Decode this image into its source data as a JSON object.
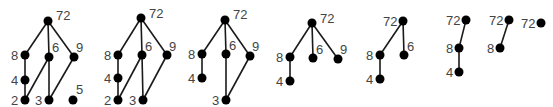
{
  "colors": {
    "node": "#000000",
    "edge": "#1a1a1a",
    "label": "#444444",
    "background": "#ffffff"
  },
  "diagrams": [
    {
      "name": "hasse-1",
      "nodes": [
        {
          "id": "72",
          "x": 48,
          "y": 21,
          "lx": 56,
          "ly": 20
        },
        {
          "id": "8",
          "x": 25,
          "y": 55,
          "lx": 11,
          "ly": 60
        },
        {
          "id": "6",
          "x": 49,
          "y": 57,
          "lx": 52,
          "ly": 52
        },
        {
          "id": "9",
          "x": 74,
          "y": 57,
          "lx": 76,
          "ly": 52
        },
        {
          "id": "4",
          "x": 25,
          "y": 80,
          "lx": 11,
          "ly": 85
        },
        {
          "id": "2",
          "x": 25,
          "y": 100,
          "lx": 11,
          "ly": 105
        },
        {
          "id": "3",
          "x": 49,
          "y": 100,
          "lx": 35,
          "ly": 105
        },
        {
          "id": "5",
          "x": 73,
          "y": 100,
          "lx": 76,
          "ly": 94
        }
      ],
      "edges": [
        [
          "72",
          "8"
        ],
        [
          "72",
          "6"
        ],
        [
          "72",
          "9"
        ],
        [
          "8",
          "4"
        ],
        [
          "4",
          "2"
        ],
        [
          "6",
          "2"
        ],
        [
          "6",
          "3"
        ],
        [
          "9",
          "3"
        ]
      ]
    },
    {
      "name": "hasse-2",
      "nodes": [
        {
          "id": "72",
          "x": 141,
          "y": 18,
          "lx": 149,
          "ly": 18
        },
        {
          "id": "8",
          "x": 118,
          "y": 55,
          "lx": 104,
          "ly": 60
        },
        {
          "id": "6",
          "x": 142,
          "y": 55,
          "lx": 145,
          "ly": 51
        },
        {
          "id": "9",
          "x": 167,
          "y": 55,
          "lx": 169,
          "ly": 51
        },
        {
          "id": "4",
          "x": 118,
          "y": 78,
          "lx": 104,
          "ly": 83
        },
        {
          "id": "2",
          "x": 118,
          "y": 100,
          "lx": 104,
          "ly": 105
        },
        {
          "id": "3",
          "x": 143,
          "y": 100,
          "lx": 129,
          "ly": 105
        }
      ],
      "edges": [
        [
          "72",
          "8"
        ],
        [
          "72",
          "6"
        ],
        [
          "72",
          "9"
        ],
        [
          "8",
          "4"
        ],
        [
          "4",
          "2"
        ],
        [
          "6",
          "2"
        ],
        [
          "6",
          "3"
        ],
        [
          "9",
          "3"
        ]
      ]
    },
    {
      "name": "hasse-3",
      "nodes": [
        {
          "id": "72",
          "x": 225,
          "y": 20,
          "lx": 233,
          "ly": 19
        },
        {
          "id": "8",
          "x": 202,
          "y": 54,
          "lx": 188,
          "ly": 59
        },
        {
          "id": "6",
          "x": 226,
          "y": 54,
          "lx": 229,
          "ly": 50
        },
        {
          "id": "9",
          "x": 250,
          "y": 56,
          "lx": 252,
          "ly": 51
        },
        {
          "id": "4",
          "x": 202,
          "y": 78,
          "lx": 188,
          "ly": 83
        },
        {
          "id": "3",
          "x": 226,
          "y": 100,
          "lx": 212,
          "ly": 105
        }
      ],
      "edges": [
        [
          "72",
          "8"
        ],
        [
          "72",
          "6"
        ],
        [
          "72",
          "9"
        ],
        [
          "8",
          "4"
        ],
        [
          "6",
          "3"
        ],
        [
          "9",
          "3"
        ]
      ]
    },
    {
      "name": "hasse-4",
      "nodes": [
        {
          "id": "72",
          "x": 312,
          "y": 23,
          "lx": 320,
          "ly": 23
        },
        {
          "id": "8",
          "x": 290,
          "y": 57,
          "lx": 276,
          "ly": 62
        },
        {
          "id": "6",
          "x": 313,
          "y": 58,
          "lx": 316,
          "ly": 54
        },
        {
          "id": "9",
          "x": 338,
          "y": 59,
          "lx": 340,
          "ly": 54
        },
        {
          "id": "4",
          "x": 290,
          "y": 81,
          "lx": 276,
          "ly": 86
        }
      ],
      "edges": [
        [
          "72",
          "8"
        ],
        [
          "72",
          "6"
        ],
        [
          "72",
          "9"
        ],
        [
          "8",
          "4"
        ]
      ]
    },
    {
      "name": "hasse-5",
      "nodes": [
        {
          "id": "72",
          "x": 403,
          "y": 21,
          "lx": 383,
          "ly": 26
        },
        {
          "id": "8",
          "x": 380,
          "y": 55,
          "lx": 366,
          "ly": 60
        },
        {
          "id": "6",
          "x": 404,
          "y": 55,
          "lx": 407,
          "ly": 51
        },
        {
          "id": "4",
          "x": 380,
          "y": 79,
          "lx": 366,
          "ly": 84
        }
      ],
      "edges": [
        [
          "72",
          "8"
        ],
        [
          "72",
          "6"
        ],
        [
          "8",
          "4"
        ]
      ]
    },
    {
      "name": "hasse-6",
      "nodes": [
        {
          "id": "72",
          "x": 466,
          "y": 20,
          "lx": 446,
          "ly": 25
        },
        {
          "id": "8",
          "x": 459,
          "y": 48,
          "lx": 446,
          "ly": 53
        },
        {
          "id": "4",
          "x": 459,
          "y": 72,
          "lx": 446,
          "ly": 77
        }
      ],
      "edges": [
        [
          "72",
          "8"
        ],
        [
          "8",
          "4"
        ]
      ]
    },
    {
      "name": "hasse-7",
      "nodes": [
        {
          "id": "72",
          "x": 509,
          "y": 20,
          "lx": 489,
          "ly": 25
        },
        {
          "id": "8",
          "x": 500,
          "y": 48,
          "lx": 487,
          "ly": 53
        }
      ],
      "edges": [
        [
          "72",
          "8"
        ]
      ]
    },
    {
      "name": "hasse-8",
      "nodes": [
        {
          "id": "72",
          "x": 541,
          "y": 23,
          "lx": 521,
          "ly": 28
        }
      ],
      "edges": []
    }
  ]
}
